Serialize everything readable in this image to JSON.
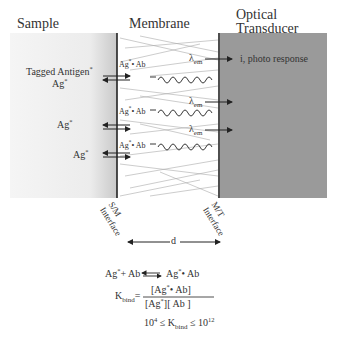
{
  "headers": {
    "sample": "Sample",
    "membrane": "Membrane",
    "transducer_line1": "Optical",
    "transducer_line2": "Transducer"
  },
  "sample_labels": {
    "tagged_antigen": "Tagged Antigen",
    "ag": "Ag"
  },
  "membrane_labels": {
    "complex": "Ag",
    "complex_suffix": "• Ab",
    "lambda": "λ",
    "lambda_sub": "em"
  },
  "transducer_labels": {
    "photo_response": "i, photo response"
  },
  "interfaces": {
    "sm_line1": "S/M",
    "sm_line2": "Interface",
    "mt_line1": "M/T",
    "mt_line2": "Interface",
    "distance": "d"
  },
  "equations": {
    "reaction_left": "Ag",
    "reaction_plus": "+ Ab",
    "reaction_right": "Ag",
    "reaction_right_suffix": "• Ab",
    "kbind_label": "K",
    "kbind_sub": "bind",
    "equals": "=",
    "numerator_left": "[Ag",
    "numerator_right": "• Ab]",
    "denominator_left": "[Ag",
    "denominator_right": "][ Ab ]",
    "range_low_base": "10",
    "range_low_exp": "4",
    "range_leq": "≤",
    "range_high_base": "10",
    "range_high_exp": "12",
    "star": "*"
  },
  "colors": {
    "sample_bg": "#f2f2f2",
    "transducer_bg": "#999999",
    "line": "#222222"
  }
}
